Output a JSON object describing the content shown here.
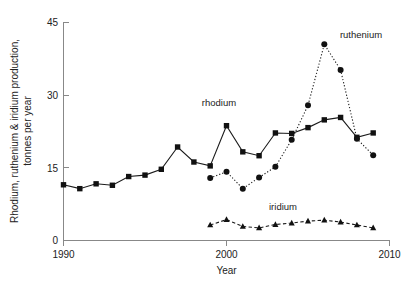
{
  "figure": {
    "background_color": "#ffffff",
    "foreground_color": "#111111",
    "axis_color": "#888888"
  },
  "axes": {
    "x_title": "Year",
    "y_title_line1": "Rhodium, ruthenium & iridium production,",
    "y_title_line2": "tonnes per year",
    "x_ticks": [
      "1990",
      "2000",
      "2010"
    ],
    "y_ticks": [
      "0",
      "15",
      "30",
      "45"
    ]
  },
  "annotations": {
    "rhodium_label": "rhodium",
    "ruthenium_label": "ruthenium",
    "iridium_label": "iridium"
  },
  "chart_data": {
    "type": "line",
    "title": "",
    "subtitle": "",
    "xlabel": "Year",
    "ylabel": "Rhodium, ruthenium & iridium production, tonnes per year",
    "xlim": [
      1990,
      2010
    ],
    "ylim": [
      0,
      45
    ],
    "x_tick_values": [
      1990,
      2000,
      2010
    ],
    "y_tick_values": [
      0,
      15,
      30,
      45
    ],
    "grid": false,
    "legend": "inline-annotations",
    "series": [
      {
        "name": "rhodium",
        "marker": "square",
        "linestyle": "solid",
        "x": [
          1990,
          1991,
          1992,
          1993,
          1994,
          1995,
          1996,
          1997,
          1998,
          1999,
          2000,
          2001,
          2002,
          2003,
          2004,
          2005,
          2006,
          2007,
          2008,
          2009
        ],
        "values": [
          11.5,
          10.7,
          11.7,
          11.4,
          13.2,
          13.5,
          14.7,
          19.3,
          16.2,
          15.4,
          23.7,
          18.3,
          17.5,
          22.2,
          22.1,
          23.3,
          24.9,
          25.4,
          21.3,
          22.2
        ]
      },
      {
        "name": "ruthenium",
        "marker": "circle",
        "linestyle": "dotted",
        "x": [
          1999,
          2000,
          2001,
          2002,
          2003,
          2004,
          2005,
          2006,
          2007,
          2008,
          2009
        ],
        "values": [
          12.9,
          14.2,
          10.7,
          13.0,
          15.2,
          20.8,
          27.9,
          40.5,
          35.2,
          21.0,
          17.6
        ]
      },
      {
        "name": "iridium",
        "marker": "triangle",
        "linestyle": "dashed",
        "x": [
          1999,
          2000,
          2001,
          2002,
          2003,
          2004,
          2005,
          2006,
          2007,
          2008,
          2009
        ],
        "values": [
          3.2,
          4.3,
          2.9,
          2.6,
          3.3,
          3.6,
          4.0,
          4.2,
          3.8,
          3.2,
          2.6
        ]
      }
    ]
  }
}
